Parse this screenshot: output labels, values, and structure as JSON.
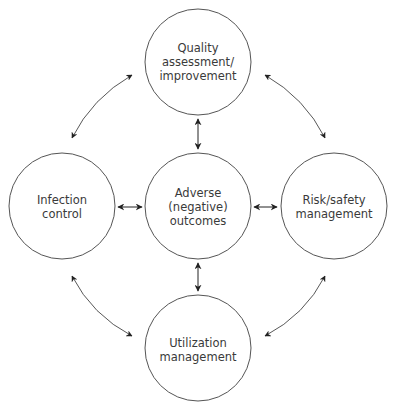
{
  "diagram": {
    "type": "hub-and-spoke cycle diagram",
    "colors": {
      "stroke": "#555555",
      "arrow": "#222222",
      "text": "#3a3a3a",
      "background": "#ffffff"
    },
    "nodes": {
      "top": {
        "id": "quality",
        "lines": [
          "Quality",
          "assessment/",
          "improvement"
        ]
      },
      "left": {
        "id": "infection",
        "lines": [
          "Infection",
          "control"
        ]
      },
      "center": {
        "id": "adverse",
        "lines": [
          "Adverse",
          "(negative)",
          "outcomes"
        ]
      },
      "right": {
        "id": "risk",
        "lines": [
          "Risk/safety",
          "management"
        ]
      },
      "bottom": {
        "id": "utilization",
        "lines": [
          "Utilization",
          "management"
        ]
      }
    },
    "edges": [
      {
        "from": "quality",
        "to": "adverse",
        "type": "bidirectional-straight"
      },
      {
        "from": "infection",
        "to": "adverse",
        "type": "bidirectional-straight"
      },
      {
        "from": "adverse",
        "to": "risk",
        "type": "bidirectional-straight"
      },
      {
        "from": "adverse",
        "to": "utilization",
        "type": "bidirectional-straight"
      },
      {
        "from": "quality",
        "to": "infection",
        "type": "bidirectional-curved"
      },
      {
        "from": "quality",
        "to": "risk",
        "type": "bidirectional-curved"
      },
      {
        "from": "infection",
        "to": "utilization",
        "type": "bidirectional-curved"
      },
      {
        "from": "risk",
        "to": "utilization",
        "type": "bidirectional-curved"
      }
    ]
  }
}
